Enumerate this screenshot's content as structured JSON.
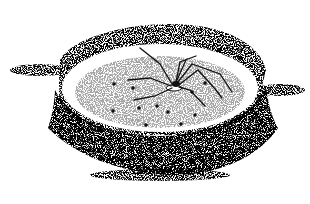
{
  "illustration": {
    "subject": "spider on a stippled sand mound with small pits",
    "style": "black-and-white stipple ink drawing",
    "colors": {
      "background": "#ffffff",
      "ink": "#111111",
      "stipple": "#444444"
    },
    "mound": {
      "cx": 150,
      "cy": 88,
      "rx": 100,
      "ry": 46,
      "base_ry": 58,
      "base_cy": 118
    },
    "spider": {
      "x": 176,
      "y": 86
    },
    "pits": [
      [
        114,
        84
      ],
      [
        133,
        88
      ],
      [
        113,
        111
      ],
      [
        139,
        108
      ],
      [
        157,
        106
      ],
      [
        168,
        112
      ],
      [
        195,
        115
      ],
      [
        146,
        125
      ],
      [
        181,
        124
      ],
      [
        205,
        83
      ],
      [
        192,
        92
      ]
    ]
  }
}
